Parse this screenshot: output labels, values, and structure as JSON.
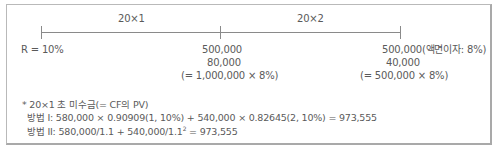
{
  "timeline": {
    "periods": [
      {
        "label": "20×1"
      },
      {
        "label": "20×2"
      }
    ],
    "rate_label": "R = 10%",
    "points": [
      {
        "lines": [
          "500,000",
          "80,000",
          "(= 1,000,000 × 8%)"
        ]
      },
      {
        "lines": [
          "500,000(액면이자: 8%)",
          "40,000",
          "(= 500,000 × 8%)"
        ]
      }
    ]
  },
  "notes": {
    "heading": "* 20×1 초 미수금(= CF의 PV)",
    "method1": "방법 I: 580,000 × 0.90909(1, 10%) + 540,000 × 0.82645(2, 10%) = 973,555",
    "method2_prefix": "방법 II: 580,000/1.1 + 540,000/1.1",
    "method2_sup": "2",
    "method2_suffix": " = 973,555"
  }
}
